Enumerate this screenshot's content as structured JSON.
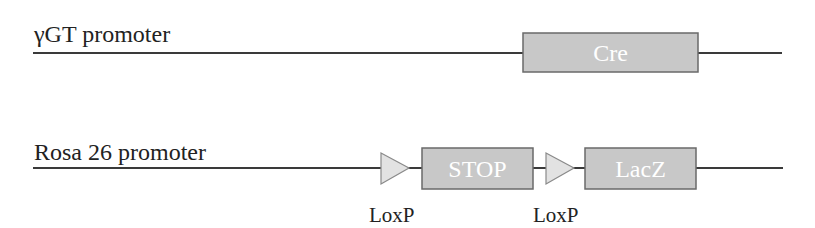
{
  "construct_1": {
    "promoter_label": "γGT promoter",
    "elements": [
      {
        "type": "box",
        "label": "Cre"
      }
    ]
  },
  "construct_2": {
    "promoter_label": "Rosa 26 promoter",
    "elements": [
      {
        "type": "triangle",
        "label": "LoxP"
      },
      {
        "type": "box",
        "label": "STOP"
      },
      {
        "type": "triangle",
        "label": "LoxP"
      },
      {
        "type": "box",
        "label": "LacZ"
      }
    ]
  },
  "colors": {
    "line": "#3a3a3a",
    "box_fill": "#c8c8c8",
    "box_stroke": "#6a6a6a",
    "triangle_fill": "#e2e2e2",
    "box_text": "#ffffff"
  }
}
